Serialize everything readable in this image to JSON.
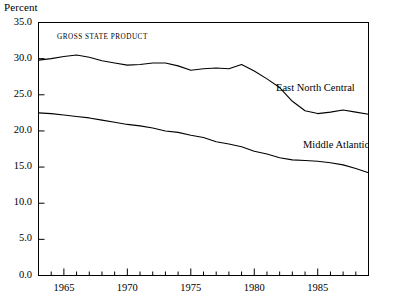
{
  "chart_data": {
    "type": "line",
    "title": "GROSS STATE PRODUCT",
    "xlabel": "",
    "ylabel": "Percent",
    "xlim": [
      1963,
      1989
    ],
    "ylim": [
      0.0,
      35.0
    ],
    "grid": false,
    "legend": "inline-labels",
    "y_ticks": [
      "0.0",
      "5.0",
      "10.0",
      "15.0",
      "20.0",
      "25.0",
      "30.0",
      "35.0"
    ],
    "y_tick_values": [
      0.0,
      5.0,
      10.0,
      15.0,
      20.0,
      25.0,
      30.0,
      35.0
    ],
    "x_ticks": [
      "1965",
      "1970",
      "1975",
      "1980",
      "1985"
    ],
    "x_tick_values": [
      1965,
      1970,
      1975,
      1980,
      1985
    ],
    "x_minor_tick_interval": 1,
    "x": [
      1963,
      1964,
      1965,
      1966,
      1967,
      1968,
      1969,
      1970,
      1971,
      1972,
      1973,
      1974,
      1975,
      1976,
      1977,
      1978,
      1979,
      1980,
      1981,
      1982,
      1983,
      1984,
      1985,
      1986,
      1987,
      1988,
      1989
    ],
    "series": [
      {
        "name": "East North Central",
        "color": "#000000",
        "values": [
          29.8,
          30.0,
          30.3,
          30.5,
          30.2,
          29.7,
          29.4,
          29.1,
          29.2,
          29.4,
          29.4,
          29.0,
          28.4,
          28.6,
          28.7,
          28.6,
          29.2,
          28.3,
          27.2,
          26.0,
          24.1,
          22.8,
          22.4,
          22.6,
          22.9,
          22.6,
          22.3
        ]
      },
      {
        "name": "Middle Atlantic",
        "color": "#000000",
        "values": [
          22.5,
          22.4,
          22.2,
          22.0,
          21.8,
          21.5,
          21.2,
          20.9,
          20.7,
          20.4,
          20.0,
          19.8,
          19.4,
          19.1,
          18.5,
          18.2,
          17.8,
          17.2,
          16.8,
          16.3,
          16.0,
          15.9,
          15.8,
          15.6,
          15.3,
          14.8,
          14.2
        ]
      }
    ]
  }
}
